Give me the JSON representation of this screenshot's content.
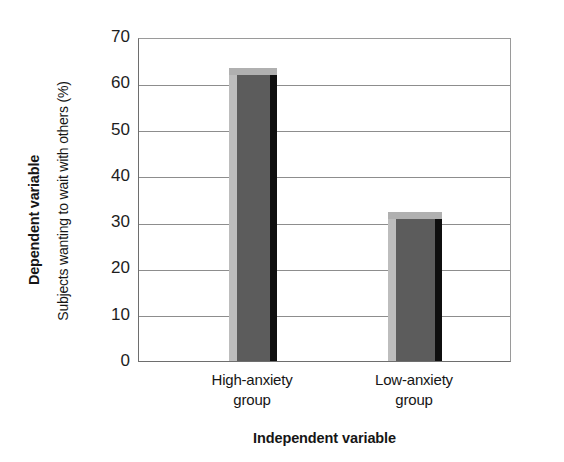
{
  "chart_data": {
    "type": "bar",
    "title": "",
    "categories": [
      "High-anxiety group",
      "Low-anxiety group"
    ],
    "category_lines": [
      [
        "High-anxiety",
        "group"
      ],
      [
        "Low-anxiety",
        "group"
      ]
    ],
    "values": [
      62,
      31
    ],
    "xlabel": "Independent variable",
    "ylabel": "Subjects wanting to wait with others (%)",
    "ylabel_outer": "Dependent variable",
    "xlabel_outer": "Independent variable",
    "ylim": [
      0,
      70
    ],
    "yticks": [
      0,
      10,
      20,
      30,
      40,
      50,
      60,
      70
    ],
    "ytick_labels": [
      "0",
      "10",
      "20",
      "30",
      "40",
      "50",
      "60",
      "70"
    ],
    "grid": true,
    "grid_axis": "y",
    "legend": false,
    "bar_style": "3d",
    "colors": {
      "bar_front": "#5c5c5c",
      "bar_left": "#bdbdbd",
      "bar_right": "#0f0f0f",
      "bar_top": "#b0b0b0",
      "gridline": "#8d8d8d",
      "axis": "#6e6e6e",
      "text": "#161616",
      "background": "#ffffff"
    }
  },
  "labels": {
    "y_axis_outer_title": "Dependent variable",
    "y_axis_inner_title": "Subjects wanting to wait with others (%)",
    "x_axis_title": "Independent variable"
  }
}
